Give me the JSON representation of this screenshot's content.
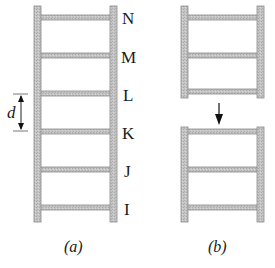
{
  "figure": {
    "colors": {
      "rail_fill": "#bdbdbd",
      "rail_edge": "#8a8a8a",
      "text": "#1a1a1a",
      "arrow": "#111111"
    },
    "panel_a": {
      "caption": "(a)",
      "rung_labels": [
        "N",
        "M",
        "L",
        "K",
        "J",
        "I"
      ],
      "spacing_label": "d"
    },
    "panel_b": {
      "caption": "(b)",
      "upper_section_rungs": 3,
      "lower_section_rungs": 3,
      "arrow_direction": "down"
    }
  }
}
